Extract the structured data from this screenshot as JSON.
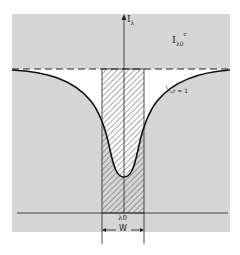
{
  "figure": {
    "type": "spectral line equivalent width diagram",
    "axis_label": "I",
    "axis_label_sub": "λ",
    "continuum_label": "I",
    "continuum_label_sub": "λ0",
    "continuum_label_sup": "c",
    "curve_label": "r ≈ 1",
    "center_label": "λ0",
    "width_label": "W",
    "colors": {
      "background": "#ffffff",
      "panel": "#d6d6d6",
      "line": "#1a1a1a",
      "dip_fill": "#ffffff",
      "hatch": "#555555"
    }
  }
}
